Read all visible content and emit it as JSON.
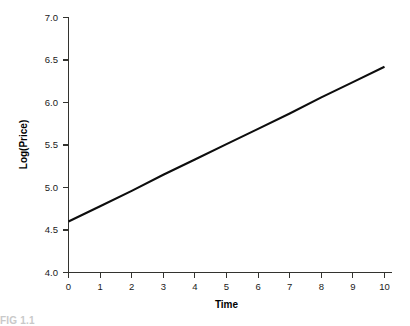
{
  "figure": {
    "background_color": "#ffffff",
    "line_color": "#0d0d0d",
    "axis_color": "#33332f",
    "bottom_edge_artifact": "FIG 1.1"
  },
  "chart_data": {
    "type": "line",
    "title": "",
    "subtitle": "",
    "xlabel": "Time",
    "ylabel": "Log(Price)",
    "xlim": [
      0,
      10
    ],
    "ylim": [
      4.0,
      7.0
    ],
    "grid": false,
    "legend": false,
    "legend_position": "none",
    "x_ticks": [
      0,
      1,
      2,
      3,
      4,
      5,
      6,
      7,
      8,
      9,
      10
    ],
    "x_tick_labels": [
      "0",
      "1",
      "2",
      "3",
      "4",
      "5",
      "6",
      "7",
      "8",
      "9",
      "10"
    ],
    "y_ticks": [
      4.0,
      4.5,
      5.0,
      5.5,
      6.0,
      6.5,
      7.0
    ],
    "y_tick_labels": [
      "4.0",
      "4.5",
      "5.0",
      "5.5",
      "6.0",
      "6.5",
      "7.0"
    ],
    "x": [
      0,
      1,
      2,
      3,
      4,
      5,
      6,
      7,
      8,
      9,
      10
    ],
    "values": [
      4.6,
      4.78,
      4.96,
      5.15,
      5.33,
      5.51,
      5.69,
      5.87,
      6.06,
      6.24,
      6.42
    ],
    "series": [
      {
        "name": "Log(Price)",
        "color": "#0d0d0d",
        "values": [
          4.6,
          4.78,
          4.96,
          5.15,
          5.33,
          5.51,
          5.69,
          5.87,
          6.06,
          6.24,
          6.42
        ]
      }
    ],
    "annotations": []
  }
}
